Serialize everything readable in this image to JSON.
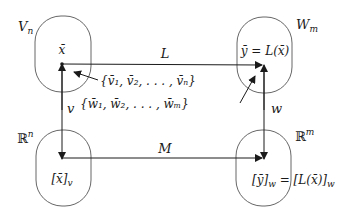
{
  "diagram": {
    "type": "commutative-diagram",
    "colors": {
      "stroke": "#1a1a1a",
      "blob": "#555555",
      "background": "#ffffff"
    },
    "nodes": {
      "top_left": {
        "space_label": "V",
        "space_sub": "n",
        "element": "x̄"
      },
      "top_right": {
        "space_label": "W",
        "space_sub": "m",
        "element": "ȳ = L(x̄)"
      },
      "bottom_left": {
        "space_label": "ℝ",
        "space_sup": "n",
        "element": "[x̄]",
        "element_sub": "v"
      },
      "bottom_right": {
        "space_label": "ℝ",
        "space_sup": "m",
        "element_left": "[ȳ]",
        "element_left_sub": "w",
        "element_eq": " = [L(x̄)]",
        "element_right_sub": "w"
      }
    },
    "edges": {
      "top": {
        "label": "L",
        "from": "top_left",
        "to": "top_right"
      },
      "bottom": {
        "label": "M",
        "from": "bottom_left",
        "to": "bottom_right"
      },
      "left": {
        "label": "v",
        "between": [
          "top_left",
          "bottom_left"
        ]
      },
      "right": {
        "label": "w",
        "between": [
          "top_right",
          "bottom_right"
        ]
      }
    },
    "annotations": {
      "basis_v": {
        "text": "{v̄₁, v̄₂, . . . , v̄ₙ}"
      },
      "basis_w": {
        "text": "{w̄₁, w̄₂, . . . , w̄ₘ}"
      }
    }
  }
}
